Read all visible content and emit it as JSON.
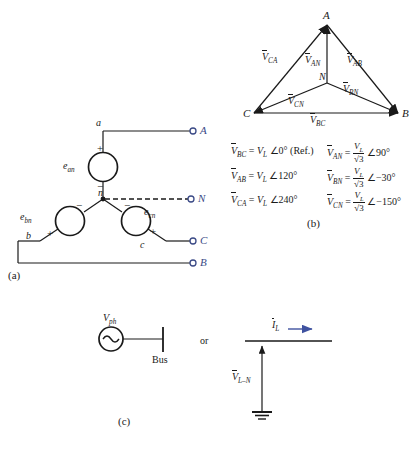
{
  "figure": {
    "panel_labels": {
      "a": "(a)",
      "b": "(b)",
      "c": "(c)"
    },
    "colors": {
      "terminal_blue": "#3b4a86",
      "arrow_blue": "#3f52a0",
      "line_black": "#1a1a1a"
    }
  },
  "panel_a": {
    "label": "(a)",
    "sources": [
      {
        "name": "e_an",
        "base": "e",
        "sub": "an",
        "plus": "+",
        "minus": "−"
      },
      {
        "name": "e_bn",
        "base": "e",
        "sub": "bn",
        "plus": "+",
        "minus": "−"
      },
      {
        "name": "e_cn",
        "base": "e",
        "sub": "cn",
        "plus": "+",
        "minus": "−"
      }
    ],
    "nodes": {
      "a": "a",
      "b": "b",
      "c": "c",
      "n": "n"
    },
    "terminals": [
      {
        "name": "terminal-A",
        "label": "A"
      },
      {
        "name": "terminal-N",
        "label": "N"
      },
      {
        "name": "terminal-C",
        "label": "C"
      },
      {
        "name": "terminal-B",
        "label": "B"
      }
    ]
  },
  "panel_b": {
    "label": "(b)",
    "vertices": {
      "A": "A",
      "B": "B",
      "C": "C",
      "N": "N"
    },
    "phasor_labels": {
      "V_CA": {
        "bar": "V",
        "sub": "CA"
      },
      "V_AN": {
        "bar": "V",
        "sub": "AN"
      },
      "V_AB": {
        "bar": "V",
        "sub": "AB"
      },
      "V_CN": {
        "bar": "V",
        "sub": "CN"
      },
      "V_BN": {
        "bar": "V",
        "sub": "BN"
      },
      "V_BC": {
        "bar": "V",
        "sub": "BC"
      }
    },
    "equations_left": [
      {
        "lhs_base": "V",
        "lhs_sub": "BC",
        "eq": "=",
        "mag": "V",
        "mag_sub": "L",
        "angle_sym": "∠",
        "angle": "0°",
        "note": "(Ref.)"
      },
      {
        "lhs_base": "V",
        "lhs_sub": "AB",
        "eq": "=",
        "mag": "V",
        "mag_sub": "L",
        "angle_sym": "∠",
        "angle": "120°",
        "note": ""
      },
      {
        "lhs_base": "V",
        "lhs_sub": "CA",
        "eq": "=",
        "mag": "V",
        "mag_sub": "L",
        "angle_sym": "∠",
        "angle": "240°",
        "note": ""
      }
    ],
    "equations_right": [
      {
        "lhs_base": "V",
        "lhs_sub": "AN",
        "eq": "=",
        "num_base": "V",
        "num_sub": "L",
        "den": "√3",
        "angle_sym": "∠",
        "angle": "90°"
      },
      {
        "lhs_base": "V",
        "lhs_sub": "BN",
        "eq": "=",
        "num_base": "V",
        "num_sub": "L",
        "den": "√3",
        "angle_sym": "∠",
        "angle": "−30°"
      },
      {
        "lhs_base": "V",
        "lhs_sub": "CN",
        "eq": "=",
        "num_base": "V",
        "num_sub": "L",
        "den": "√3",
        "angle_sym": "∠",
        "angle": "−150°"
      }
    ]
  },
  "panel_c": {
    "label": "(c)",
    "source_label": {
      "base": "V",
      "sub": "ph"
    },
    "bus_label": "Bus",
    "or_label": "or",
    "current_label": {
      "bar": "I",
      "sub": "L"
    },
    "voltage_label": {
      "bar": "V",
      "sub": "L–N"
    }
  }
}
